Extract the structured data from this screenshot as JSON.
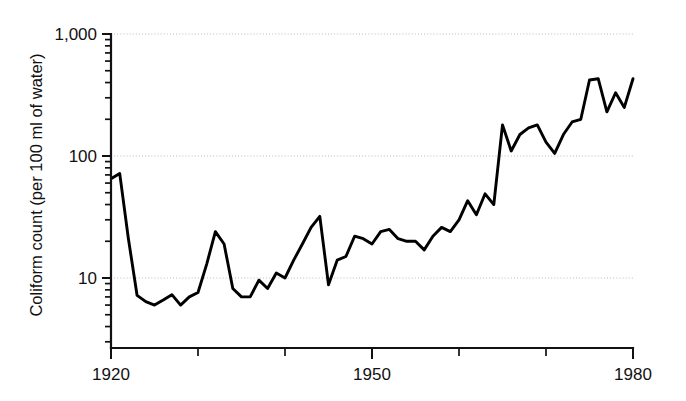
{
  "chart_data": {
    "type": "line",
    "title": "",
    "xlabel": "",
    "ylabel": "Coliform count (per 100 ml of water)",
    "yscale": "log",
    "ylim": [
      3,
      1000
    ],
    "xlim": [
      1920,
      1980
    ],
    "grid": true,
    "legend": "none",
    "y_tick_labels": [
      "1,000",
      "100",
      "10"
    ],
    "y_tick_values": [
      1000,
      100,
      10
    ],
    "x_tick_labels": [
      "1920",
      "1950",
      "1980"
    ],
    "x_tick_values": [
      1920,
      1950,
      1980
    ],
    "x_minor_tick_values": [
      1930,
      1940,
      1960,
      1970
    ],
    "series": [
      {
        "name": "Coliform count",
        "color": "#000000",
        "x": [
          1920,
          1921,
          1922,
          1923,
          1924,
          1925,
          1926,
          1927,
          1928,
          1929,
          1930,
          1931,
          1932,
          1933,
          1934,
          1935,
          1936,
          1937,
          1938,
          1939,
          1940,
          1941,
          1942,
          1943,
          1944,
          1945,
          1946,
          1947,
          1948,
          1949,
          1950,
          1951,
          1952,
          1953,
          1954,
          1955,
          1956,
          1957,
          1958,
          1959,
          1960,
          1961,
          1962,
          1963,
          1964,
          1965,
          1966,
          1967,
          1968,
          1969,
          1970,
          1971,
          1972,
          1973,
          1974,
          1975,
          1976,
          1977,
          1978,
          1979,
          1980
        ],
        "values": [
          65,
          72,
          21,
          7.2,
          6.4,
          6.0,
          6.6,
          7.3,
          6.0,
          7.0,
          7.6,
          13,
          24,
          19,
          8.2,
          7.0,
          7.0,
          9.6,
          8.2,
          11,
          10,
          14,
          19,
          26,
          32,
          8.8,
          14,
          15,
          22,
          21,
          19,
          24,
          25,
          21,
          20,
          20,
          17,
          22,
          26,
          24,
          30,
          43,
          33,
          49,
          40,
          180,
          110,
          150,
          170,
          180,
          130,
          105,
          150,
          190,
          200,
          420,
          430,
          230,
          330,
          250,
          430
        ]
      }
    ]
  },
  "axis": {
    "y_label_text": "Coliform count (per 100 ml of water)"
  }
}
